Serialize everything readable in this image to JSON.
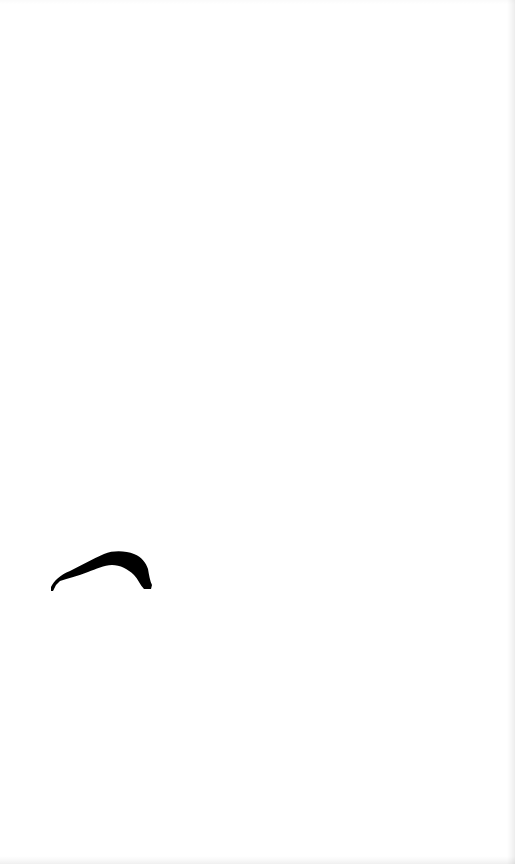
{
  "canvas": {
    "width": 515,
    "height": 864,
    "background_color": "#ffffff",
    "edge_shade_color": "#eeeeee"
  },
  "shapes": [
    {
      "type": "brush-stroke-arc",
      "color": "#000000",
      "bbox": {
        "x": 50,
        "y": 550,
        "width": 102,
        "height": 40
      }
    }
  ]
}
